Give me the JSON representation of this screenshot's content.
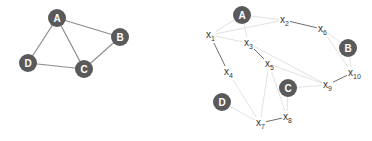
{
  "left_graph": {
    "nodes": [
      {
        "id": "A",
        "label": "A",
        "x": 57,
        "y": 18
      },
      {
        "id": "B",
        "label": "B",
        "x": 120,
        "y": 37
      },
      {
        "id": "C",
        "label": "C",
        "x": 84,
        "y": 69
      },
      {
        "id": "D",
        "label": "D",
        "x": 28,
        "y": 63
      }
    ],
    "edges": [
      [
        "A",
        "B"
      ],
      [
        "A",
        "C"
      ],
      [
        "A",
        "D"
      ],
      [
        "B",
        "C"
      ],
      [
        "C",
        "D"
      ]
    ]
  },
  "right_graph": {
    "nodes": [
      {
        "id": "A",
        "label": "A",
        "x": 242,
        "y": 15
      },
      {
        "id": "B",
        "label": "B",
        "x": 348,
        "y": 48
      },
      {
        "id": "C",
        "label": "C",
        "x": 288,
        "y": 88
      },
      {
        "id": "D",
        "label": "D",
        "x": 222,
        "y": 102
      }
    ],
    "variables": [
      {
        "id": "x1",
        "base": "x",
        "sub": "1",
        "x": 206,
        "y": 38
      },
      {
        "id": "x2",
        "base": "x",
        "sub": "2",
        "x": 280,
        "y": 23
      },
      {
        "id": "x3",
        "base": "x",
        "sub": "3",
        "x": 244,
        "y": 46
      },
      {
        "id": "x4",
        "base": "x",
        "sub": "4",
        "x": 224,
        "y": 75
      },
      {
        "id": "x5",
        "base": "x",
        "sub": "5",
        "x": 265,
        "y": 67
      },
      {
        "id": "x6",
        "base": "x",
        "sub": "6",
        "x": 318,
        "y": 32
      },
      {
        "id": "x7",
        "base": "x",
        "sub": "7",
        "x": 256,
        "y": 126
      },
      {
        "id": "x8",
        "base": "x",
        "sub": "8",
        "x": 283,
        "y": 120
      },
      {
        "id": "x9",
        "base": "x",
        "sub": "9",
        "x": 323,
        "y": 88
      },
      {
        "id": "x10",
        "base": "x",
        "sub": "10",
        "x": 348,
        "y": 76
      }
    ],
    "dark_edges": [
      [
        "x2",
        "x6"
      ],
      [
        "x1",
        "x4"
      ],
      [
        "x3",
        "x5"
      ],
      [
        "x9",
        "x10"
      ],
      [
        "x7",
        "x8"
      ]
    ],
    "faint_edges": [
      [
        "A",
        "x1"
      ],
      [
        "A",
        "x3"
      ],
      [
        "A",
        "x2"
      ],
      [
        "x1",
        "x2"
      ],
      [
        "x1",
        "x3"
      ],
      [
        "x5",
        "x9"
      ],
      [
        "x5",
        "x8"
      ],
      [
        "x5",
        "x7"
      ],
      [
        "x6",
        "B"
      ],
      [
        "x6",
        "x10"
      ],
      [
        "B",
        "x10"
      ],
      [
        "C",
        "x9"
      ],
      [
        "C",
        "x8"
      ],
      [
        "D",
        "x7"
      ],
      [
        "x4",
        "x7"
      ],
      [
        "x3",
        "x9"
      ]
    ]
  },
  "colors": {
    "node_fill": "#5a5a5a",
    "node_text": "#ffffff",
    "left_edge": "#8c8c8c",
    "dark_edge": "#707070",
    "faint_edge": "#e2e2e2",
    "variable_text": "#333333"
  }
}
